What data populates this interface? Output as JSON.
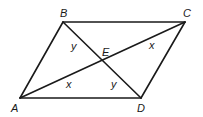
{
  "diagram": {
    "type": "geometry",
    "shape": "parallelogram",
    "vertices": [
      {
        "name": "A",
        "x": 20,
        "y": 98,
        "label": "A",
        "lx": 11,
        "ly": 112
      },
      {
        "name": "B",
        "x": 63,
        "y": 22,
        "label": "B",
        "lx": 60,
        "ly": 17
      },
      {
        "name": "C",
        "x": 185,
        "y": 22,
        "label": "C",
        "lx": 183,
        "ly": 17
      },
      {
        "name": "D",
        "x": 141,
        "y": 98,
        "label": "D",
        "lx": 137,
        "ly": 112
      }
    ],
    "intersection": {
      "name": "E",
      "x": 101,
      "y": 61,
      "label": "E",
      "lx": 102,
      "ly": 56
    },
    "sides": [
      [
        "A",
        "B"
      ],
      [
        "B",
        "C"
      ],
      [
        "C",
        "D"
      ],
      [
        "D",
        "A"
      ]
    ],
    "diagonals": [
      [
        "A",
        "C"
      ],
      [
        "B",
        "D"
      ]
    ],
    "angle_labels": [
      {
        "text": "y",
        "x": 71,
        "y": 50,
        "at": "angle ABD"
      },
      {
        "text": "x",
        "x": 149,
        "y": 49,
        "at": "angle ACB"
      },
      {
        "text": "x",
        "x": 66,
        "y": 88,
        "at": "angle CAD"
      },
      {
        "text": "y",
        "x": 111,
        "y": 88,
        "at": "angle BDA"
      }
    ]
  }
}
